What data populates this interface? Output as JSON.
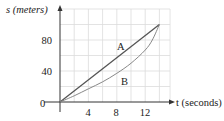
{
  "chart_data": {
    "type": "line",
    "title": "",
    "xlabel": "t (seconds)",
    "ylabel": "s (meters)",
    "xlim": [
      0,
      16
    ],
    "ylim": [
      0,
      120
    ],
    "xticks": [
      0,
      4,
      8,
      12
    ],
    "yticks": [
      40,
      80
    ],
    "origin_label": "0",
    "grid": true,
    "grid_step": {
      "x": 2,
      "y": 20
    },
    "series": [
      {
        "name": "A",
        "x": [
          0,
          14
        ],
        "y": [
          0,
          100
        ],
        "color": "#555555"
      },
      {
        "name": "B",
        "x": [
          0,
          2,
          4,
          6,
          8,
          10,
          12,
          13,
          14
        ],
        "y": [
          0,
          8,
          17,
          26,
          37,
          50,
          67,
          80,
          100
        ],
        "color": "#888888"
      }
    ],
    "annotations": [
      {
        "text": "A",
        "x": 8.7,
        "y": 73
      },
      {
        "text": "B",
        "x": 9.3,
        "y": 28
      }
    ]
  },
  "labels": {
    "y_axis": "s (meters)",
    "x_axis": "t (seconds)",
    "origin": "0",
    "x_ticks": [
      "4",
      "8",
      "12"
    ],
    "y_ticks": [
      "40",
      "80"
    ],
    "curve_a": "A",
    "curve_b": "B"
  }
}
